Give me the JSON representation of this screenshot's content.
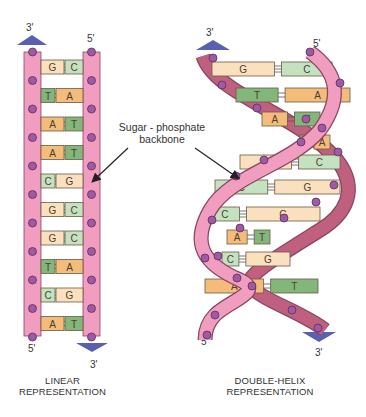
{
  "colors": {
    "backbone_fill": "#f19dc0",
    "backbone_dark": "#c0607f",
    "backbone_edge": "#8a4560",
    "phosphate": "#a05aa3",
    "A": "#f4bc7a",
    "T": "#82b67a",
    "G": "#fbe0bf",
    "C": "#c5e2c0",
    "bond": "#555555",
    "arrow_triangle": "#5a60b0"
  },
  "linear": {
    "top_left_end": "3'",
    "top_right_end": "5'",
    "bottom_left_end": "5'",
    "bottom_right_end": "3'",
    "pairs": [
      [
        "G",
        "C"
      ],
      [
        "T",
        "A"
      ],
      [
        "A",
        "T"
      ],
      [
        "A",
        "T"
      ],
      [
        "C",
        "G"
      ],
      [
        "G",
        "C"
      ],
      [
        "G",
        "C"
      ],
      [
        "T",
        "A"
      ],
      [
        "C",
        "G"
      ],
      [
        "A",
        "T"
      ]
    ],
    "caption_line1": "LINEAR",
    "caption_line2": "REPRESENTATION"
  },
  "helix": {
    "top_left_end": "3'",
    "top_right_end": "5'",
    "bottom_left_end": "5'",
    "bottom_right_end": "3'",
    "pairs": [
      [
        "G",
        "C"
      ],
      [
        "T",
        "A"
      ],
      [
        "A",
        "T"
      ],
      [
        "T",
        "A"
      ],
      [
        "G",
        "C"
      ],
      [
        "C",
        "G"
      ],
      [
        "C",
        "G"
      ],
      [
        "A",
        "T"
      ],
      [
        "C",
        "G"
      ],
      [
        "A",
        "T"
      ]
    ],
    "caption_line1": "DOUBLE-HELIX",
    "caption_line2": "REPRESENTATION"
  },
  "annotation": {
    "line1": "Sugar - phosphate",
    "line2": "backbone"
  }
}
